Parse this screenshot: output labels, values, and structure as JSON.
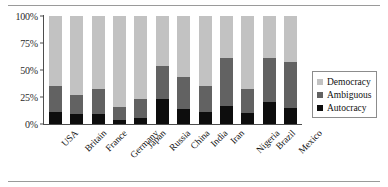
{
  "chart_data": {
    "type": "bar",
    "subtype": "stacked-bar-percent",
    "title": "",
    "xlabel": "",
    "ylabel": "",
    "ylim": [
      0,
      100
    ],
    "ytick_labels": [
      "0%",
      "25%",
      "50%",
      "75%",
      "100%"
    ],
    "ytick_values": [
      0,
      25,
      50,
      75,
      100
    ],
    "grid": false,
    "legend_position": "right",
    "categories": [
      "USA",
      "Britain",
      "France",
      "Germany",
      "Japan",
      "Russia",
      "China",
      "India",
      "Iran",
      "Nigeria",
      "Brazil",
      "Mexico"
    ],
    "series": [
      {
        "name": "Autocracy",
        "color": "#0d0d0d",
        "values": [
          11,
          9,
          9,
          4,
          6,
          23,
          14,
          11,
          17,
          10,
          20,
          15
        ]
      },
      {
        "name": "Ambiguous",
        "color": "#626262",
        "values": [
          24,
          18,
          23,
          12,
          17,
          31,
          30,
          24,
          44,
          22,
          41,
          42
        ]
      },
      {
        "name": "Democracy",
        "color": "#c2c2c2",
        "values": [
          65,
          73,
          68,
          84,
          77,
          46,
          56,
          65,
          39,
          68,
          39,
          43
        ]
      }
    ],
    "cumulative_tops": {
      "autocracy": [
        11,
        9,
        9,
        4,
        6,
        23,
        14,
        11,
        17,
        10,
        20,
        15
      ],
      "ambiguous": [
        35,
        27,
        32,
        16,
        23,
        54,
        44,
        35,
        61,
        32,
        61,
        57
      ],
      "democracy": [
        100,
        100,
        100,
        100,
        100,
        100,
        100,
        100,
        100,
        100,
        100,
        100
      ]
    }
  },
  "legend": {
    "entries": [
      {
        "label": "Democracy",
        "key": "democracy"
      },
      {
        "label": "Ambiguous",
        "key": "ambiguous"
      },
      {
        "label": "Autocracy",
        "key": "autocracy"
      }
    ]
  },
  "colors": {
    "democracy": "#c2c2c2",
    "ambiguous": "#626262",
    "autocracy": "#0d0d0d",
    "axis": "#4d4d4d",
    "rule": "#9a9a9a",
    "text": "#111111",
    "background": "#ffffff"
  }
}
